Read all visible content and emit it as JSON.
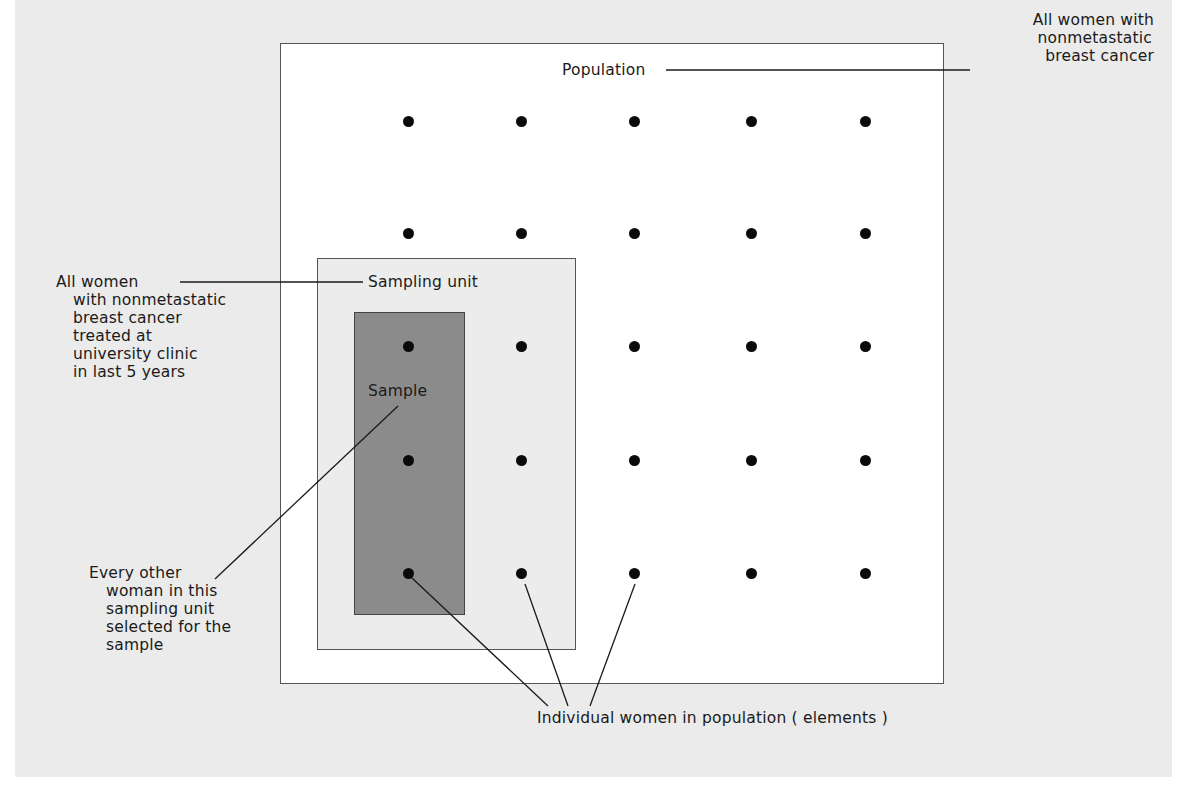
{
  "diagram": {
    "population": {
      "label": "Population",
      "description_lines": [
        "All women with",
        "nonmetastatic",
        "breast cancer"
      ]
    },
    "sampling_unit": {
      "label": "Sampling unit",
      "description_lines": [
        "All women",
        "with nonmetastatic",
        "breast cancer",
        "treated at",
        "university clinic",
        "in last 5 years"
      ]
    },
    "sample": {
      "label": "Sample",
      "description_lines": [
        "Every other",
        "woman in this",
        "sampling unit",
        "selected for the",
        "sample"
      ]
    },
    "elements": {
      "label": "Individual women in population ( elements )",
      "grid": {
        "rows": 5,
        "cols": 5,
        "col_x": [
          408,
          521,
          634,
          751,
          865
        ],
        "row_y": [
          121,
          233,
          346,
          460,
          573
        ]
      }
    },
    "colors": {
      "page_background": "#ebebeb",
      "population_fill": "#ffffff",
      "sampling_unit_fill": "#ececec",
      "sample_fill": "#8b8b8b",
      "dot_color": "#0a0a0a",
      "line_color": "#1a1a1a"
    }
  }
}
